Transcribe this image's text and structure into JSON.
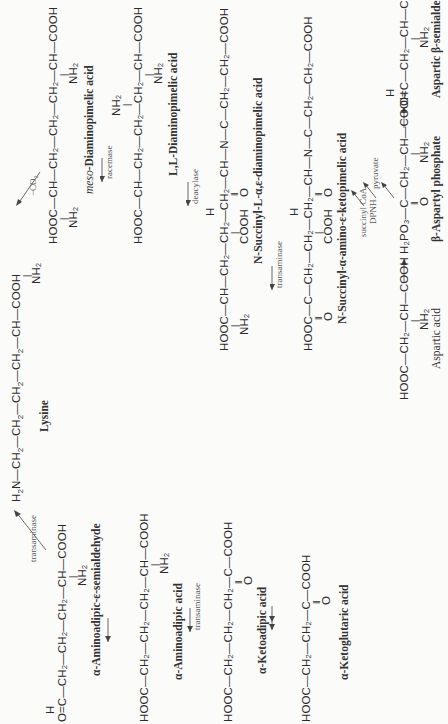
{
  "compounds": {
    "lysine": {
      "formula_parts": [
        "H",
        "2",
        "N—CH",
        "2",
        "—CH",
        "2",
        "—CH",
        "2",
        "—CH",
        "2",
        "—CH—COOH"
      ],
      "sub": "NH",
      "sub2": "2",
      "name": "Lysine"
    },
    "meso_dap": {
      "formula": "HOOC—CH—CH₂—CH₂—CH₂—CH—COOH",
      "name_prefix": "meso",
      "name": "-Diaminopimelic acid"
    },
    "ll_dap": {
      "formula": "HOOC—CH—CH₂—CH₂—CH₂—CH—COOH",
      "name": "L,L-Diaminopimelic acid"
    },
    "n_succinyl_dap": {
      "formula": "HOOC—CH—CH₂—CH₂—CH₂—CH—N—C—CH₂—CH₂—COOH",
      "name": "N-Succinyl-L-α,ε-diaminopimelic acid"
    },
    "n_succinyl_keto": {
      "formula": "HOOC—C—CH₂—CH₂—CH₂—CH—N—C—CH₂—CH₂—COOH",
      "name": "N-Succinyl-α-amino-ε-ketopimelic acid"
    },
    "aspartic_semialdehyde": {
      "formula": "O=C—CH₂—CH—COOH",
      "name": "Aspartic β-semialdehyde"
    },
    "aspartyl_phosphate": {
      "formula": "H₂PO₃—C—CH₂—CH—COOH",
      "name": "β-Aspartyl phosphate"
    },
    "aspartic_acid": {
      "formula": "HOOC—CH₂—CH—COOH",
      "name": "Aspartic acid"
    },
    "aminoadipic_semialdehyde": {
      "formula": "O=C—CH₂—CH₂—CH₂—CH—COOH",
      "name": "α-Aminoadipic-ε-semialdehyde"
    },
    "aminoadipic": {
      "formula": "HOOC—CH₂—CH₂—CH₂—CH—COOH",
      "name": "α-Aminoadipic acid"
    },
    "ketoadipic": {
      "formula": "HOOC—CH₂—CH₂—CH₂—C—COOH",
      "name": "α-Ketoadipic acid"
    },
    "ketoglutaric": {
      "formula": "HOOC—CH₂—CH₂—C—COOH",
      "name": "α-Ketoglutaric acid"
    }
  },
  "enzymes": {
    "decarboxylation": "−CO₂",
    "racemase": "racemase",
    "deacylase": "deacylase",
    "transaminase_dap": "transaminase",
    "succinyl_coa": "succinyl CoA",
    "dpnh": "DPNH",
    "pyruvate": "pyruvate",
    "transaminase_lys": "transaminase",
    "transaminase_adipic": "transaminase"
  },
  "atoms": {
    "H": "H",
    "O": "O",
    "NH2": "NH₂",
    "COOH": "COOH",
    "dbl": "‖"
  }
}
